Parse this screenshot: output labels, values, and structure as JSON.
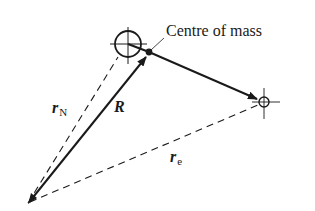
{
  "diagram": {
    "type": "vector-diagram",
    "colors": {
      "line": "#1a1a1a",
      "background": "#ffffff"
    },
    "labels": {
      "centre_of_mass": "Centre of mass",
      "r_N": {
        "symbol": "r",
        "subscript": "N"
      },
      "R": {
        "symbol": "R"
      },
      "r_e": {
        "symbol": "r",
        "subscript": "e"
      }
    },
    "points": {
      "origin": [
        28,
        203
      ],
      "nucleus": [
        128,
        44
      ],
      "centre_of_mass": [
        149,
        52
      ],
      "electron": [
        264,
        102
      ]
    },
    "vectors": [
      {
        "name": "R",
        "from": "origin",
        "to": "centre_of_mass",
        "style": "solid",
        "arrow": "end"
      },
      {
        "name": "com-to-electron",
        "from": "centre_of_mass",
        "to": "electron",
        "style": "solid",
        "arrow": "end"
      },
      {
        "name": "r_N",
        "from": "origin",
        "to": "nucleus",
        "style": "dashed",
        "arrow": "none"
      },
      {
        "name": "r_e",
        "from": "origin",
        "to": "electron",
        "style": "dashed",
        "arrow": "none"
      }
    ],
    "markers": [
      {
        "name": "nucleus-marker",
        "shape": "circle-crosshair",
        "radius": 13
      },
      {
        "name": "electron-marker",
        "shape": "circle-crosshair",
        "radius": 5
      }
    ]
  }
}
